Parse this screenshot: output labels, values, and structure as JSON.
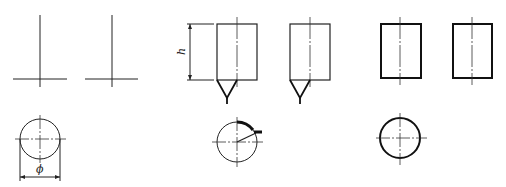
{
  "diagram": {
    "type": "technical-drawing",
    "colors": {
      "line": "#222222",
      "background": "#ffffff"
    },
    "labels": {
      "height": "h",
      "diameter": "ϕ"
    },
    "groups": [
      {
        "name": "thin-line-representation",
        "views": [
          "front-view-1",
          "front-view-2",
          "top-view-circle"
        ]
      },
      {
        "name": "v-weld-representation",
        "views": [
          "front-view-1",
          "front-view-2",
          "top-view-circle-with-leader"
        ]
      },
      {
        "name": "bold-outline-representation",
        "views": [
          "front-view-1",
          "front-view-2",
          "top-view-circle"
        ]
      }
    ]
  }
}
